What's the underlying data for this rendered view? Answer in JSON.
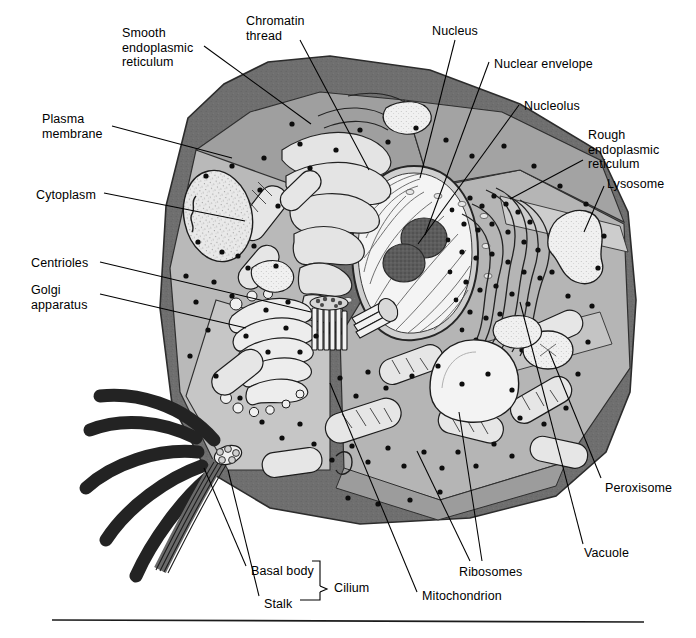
{
  "figure": {
    "background": "#ffffff",
    "width": 696,
    "height": 638
  },
  "palette": {
    "membrane_dark": "#6f6f6f",
    "membrane_edge": "#4a4a4a",
    "cytoplasm_light": "#b9b9b9",
    "cytoplasm_mid": "#a8a8a8",
    "cytoplasm_pale": "#c8c8c8",
    "nucleus_dark": "#6e6e6e",
    "nucleoplasm": "#f2f2f2",
    "nucleolus": "#5a5a5a",
    "organelle_fill": "#e8e8e8",
    "ribosome_dot": "#121212",
    "leader_line": "#000000",
    "text": "#000000",
    "rule": "#1b1b1b"
  },
  "labels": [
    {
      "id": "smooth-er",
      "text": "Smooth\nendoplasmic\nreticulum",
      "x": 122,
      "y": 26,
      "align": "left"
    },
    {
      "id": "chromatin-thread",
      "text": "Chromatin\nthread",
      "x": 246,
      "y": 14,
      "align": "left"
    },
    {
      "id": "nucleus",
      "text": "Nucleus",
      "x": 432,
      "y": 24,
      "align": "left"
    },
    {
      "id": "nuclear-envelope",
      "text": "Nuclear envelope",
      "x": 494,
      "y": 57,
      "align": "left"
    },
    {
      "id": "nucleolus",
      "text": "Nucleolus",
      "x": 524,
      "y": 99,
      "align": "left"
    },
    {
      "id": "rough-er",
      "text": "Rough\nendoplasmic\nreticulum",
      "x": 588,
      "y": 128,
      "align": "left"
    },
    {
      "id": "lysosome",
      "text": "Lysosome",
      "x": 607,
      "y": 177,
      "align": "left"
    },
    {
      "id": "plasma-membrane",
      "text": "Plasma\nmembrane",
      "x": 42,
      "y": 112,
      "align": "left"
    },
    {
      "id": "cytoplasm",
      "text": "Cytoplasm",
      "x": 36,
      "y": 188,
      "align": "left"
    },
    {
      "id": "centrioles",
      "text": "Centrioles",
      "x": 31,
      "y": 256,
      "align": "left"
    },
    {
      "id": "golgi-apparatus",
      "text": "Golgi\napparatus",
      "x": 31,
      "y": 283,
      "align": "left"
    },
    {
      "id": "peroxisome",
      "text": "Peroxisome",
      "x": 605,
      "y": 481,
      "align": "left"
    },
    {
      "id": "vacuole",
      "text": "Vacuole",
      "x": 584,
      "y": 546,
      "align": "left"
    },
    {
      "id": "ribosomes",
      "text": "Ribosomes",
      "x": 459,
      "y": 565,
      "align": "left"
    },
    {
      "id": "mitochondrion",
      "text": "Mitochondrion",
      "x": 422,
      "y": 589,
      "align": "left"
    },
    {
      "id": "basal-body",
      "text": "Basal body",
      "x": 251,
      "y": 564,
      "align": "left"
    },
    {
      "id": "stalk",
      "text": "Stalk",
      "x": 264,
      "y": 597,
      "align": "left"
    },
    {
      "id": "cilium",
      "text": "Cilium",
      "x": 334,
      "y": 581,
      "align": "left"
    }
  ],
  "bracket": {
    "id": "cilium-bracket",
    "groups": [
      "Basal body",
      "Stalk"
    ],
    "label": "Cilium"
  },
  "leaders": [
    {
      "id": "leader-smooth-er",
      "points": "204,46 311,124"
    },
    {
      "id": "leader-chromatin",
      "points": "300,40 369,170"
    },
    {
      "id": "leader-nucleus",
      "points": "455,40 420,178"
    },
    {
      "id": "leader-nuclear-envelope",
      "points": "489,62 425,235"
    },
    {
      "id": "leader-nucleolus",
      "points": "519,105 418,244"
    },
    {
      "id": "leader-rough-er",
      "points": "583,160 510,199"
    },
    {
      "id": "leader-lysosome",
      "points": "604,186 588,228"
    },
    {
      "id": "leader-plasma-membrane",
      "points": "112,126 232,158"
    },
    {
      "id": "leader-cytoplasm",
      "points": "104,193 245,221"
    },
    {
      "id": "leader-centrioles",
      "points": "100,262 311,312"
    },
    {
      "id": "leader-golgi",
      "points": "100,294 246,328"
    },
    {
      "id": "leader-peroxisome",
      "points": "601,478 549,351"
    },
    {
      "id": "leader-vacuole",
      "points": "583,544 520,302"
    },
    {
      "id": "leader-ribosomes",
      "points": "482,561 459,412"
    },
    {
      "id": "leader-ribosomes-2",
      "points": "470,561 417,451"
    },
    {
      "id": "leader-mitochondrion",
      "points": "417,592 330,383"
    },
    {
      "id": "leader-basal-body",
      "points": "246,566 204,468"
    },
    {
      "id": "leader-stalk",
      "points": "259,596 228,470"
    }
  ],
  "organelles": [
    {
      "id": "nucleus",
      "name": "nucleus"
    },
    {
      "id": "nucleolus-a",
      "name": "nucleolus"
    },
    {
      "id": "nucleolus-b",
      "name": "nucleolus"
    },
    {
      "id": "nuclear-envelope",
      "name": "nuclear-envelope"
    },
    {
      "id": "rough-er",
      "name": "rough-endoplasmic-reticulum"
    },
    {
      "id": "smooth-er",
      "name": "smooth-endoplasmic-reticulum"
    },
    {
      "id": "golgi",
      "name": "golgi-apparatus"
    },
    {
      "id": "centrioles",
      "name": "centrioles"
    },
    {
      "id": "lysosome",
      "name": "lysosome"
    },
    {
      "id": "peroxisome",
      "name": "peroxisome"
    },
    {
      "id": "vacuole",
      "name": "vacuole"
    },
    {
      "id": "mitochondria",
      "name": "mitochondria"
    },
    {
      "id": "ribosomes",
      "name": "ribosomes"
    },
    {
      "id": "cilia",
      "name": "cilia"
    },
    {
      "id": "basal-body",
      "name": "basal-body"
    },
    {
      "id": "plasma-membrane",
      "name": "plasma-membrane"
    }
  ]
}
